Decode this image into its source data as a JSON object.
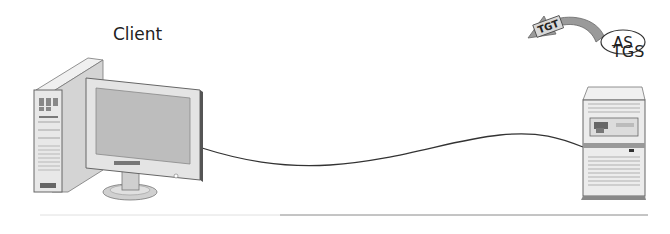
{
  "diagram": {
    "client": {
      "label": "Client"
    },
    "server": {
      "as_label": "AS",
      "tgs_label": "TGS"
    },
    "ticket": {
      "label": "TGT"
    },
    "colors": {
      "line": "#333333",
      "device_fill": "#e6e6e6",
      "device_shade": "#c8c8c8",
      "screen": "#b8b8b8",
      "arrow_fill": "#9a9a9a",
      "ticket_fill": "#d8d8d8"
    }
  }
}
